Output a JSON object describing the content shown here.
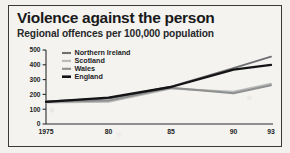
{
  "figure": {
    "title": "Violence against the person",
    "subtitle": "Regional offences per 100,000 population",
    "border_color": "#3a3a38",
    "background_color": "#f4f3f0"
  },
  "chart_data": {
    "type": "line",
    "title": "Violence against the person",
    "subtitle": "Regional offences per 100,000 population",
    "xlabel": "",
    "ylabel": "Regional offences per 100,000 population",
    "x": [
      1975,
      1980,
      1985,
      1990,
      1993
    ],
    "tick_labels_x": [
      "1975",
      "80",
      "85",
      "90",
      "93"
    ],
    "tick_values_y": [
      0,
      100,
      200,
      300,
      400,
      500
    ],
    "ylim": [
      0,
      500
    ],
    "xlim": [
      1975,
      1993
    ],
    "grid": false,
    "legend_position": "top-left",
    "series": [
      {
        "name": "Northern Ireland",
        "color": "#6e6f71",
        "values": [
          152,
          172,
          252,
          378,
          455
        ]
      },
      {
        "name": "Scotland",
        "color": "#b9bab8",
        "values": [
          145,
          150,
          240,
          218,
          272
        ]
      },
      {
        "name": "Wales",
        "color": "#8e8f8f",
        "values": [
          150,
          158,
          245,
          208,
          262
        ]
      },
      {
        "name": "England",
        "color": "#141416",
        "values": [
          150,
          178,
          250,
          368,
          400
        ]
      }
    ]
  }
}
